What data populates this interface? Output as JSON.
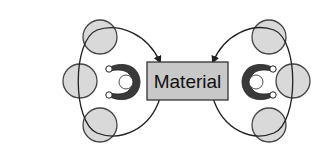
{
  "diagram": {
    "center_box": {
      "label": "Material",
      "fill": "#c8c8c8",
      "stroke": "#333333"
    },
    "left_group": {
      "person": "operator-left",
      "positions": 3,
      "flow_arrow": "into-material"
    },
    "right_group": {
      "person": "operator-right",
      "positions": 3,
      "flow_arrow": "into-material"
    },
    "colors": {
      "circle_fill": "#d9d9d9",
      "circle_stroke": "#444444",
      "person_fill": "#3a3a3a",
      "line": "#222222"
    }
  }
}
